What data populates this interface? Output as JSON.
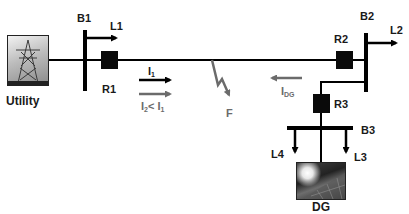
{
  "diagram": {
    "title": "",
    "nodes": {
      "utility": {
        "label": "Utility",
        "icon": "transmission-tower-image"
      },
      "dg": {
        "label": "DG",
        "icon": "solar-panel-image"
      }
    },
    "buses": {
      "b1": {
        "label": "B1"
      },
      "b2": {
        "label": "B2"
      },
      "b3": {
        "label": "B3"
      }
    },
    "relays": {
      "r1": {
        "label": "R1"
      },
      "r2": {
        "label": "R2"
      },
      "r3": {
        "label": "R3"
      }
    },
    "loads": {
      "l1": {
        "label": "L1"
      },
      "l2": {
        "label": "L2"
      },
      "l3": {
        "label": "L3"
      },
      "l4": {
        "label": "L4"
      }
    },
    "fault": {
      "label": "F"
    },
    "currents": {
      "i1": {
        "base": "I",
        "sub": "1",
        "color": "#000000"
      },
      "i2": {
        "base": "I",
        "sub": "2",
        "relation": "<",
        "compare_base": "I",
        "compare_sub": "1",
        "color": "#6b6b6b"
      },
      "idg": {
        "base": "I",
        "sub": "DG",
        "color": "#6b6b6b"
      }
    },
    "colors": {
      "line": "#000000",
      "gray_arrow": "#6b6b6b",
      "relay": "#0a0a0a"
    }
  }
}
